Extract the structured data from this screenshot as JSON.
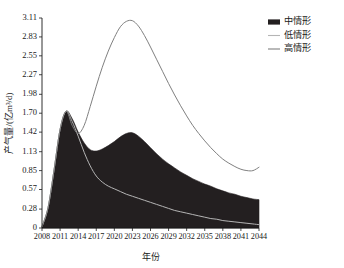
{
  "chart_data": {
    "type": "area",
    "title": "",
    "xlabel": "年份",
    "ylabel": "产气量/(亿m³/d)",
    "xlim": [
      2008,
      2044
    ],
    "ylim": [
      0,
      3.11
    ],
    "grid": false,
    "legend_position": "top-right",
    "x_ticks": [
      "2008",
      "2011",
      "2014",
      "2017",
      "2020",
      "2023",
      "2026",
      "2029",
      "2032",
      "2035",
      "2038",
      "2041",
      "2044"
    ],
    "x_tick_values": [
      2008,
      2011,
      2014,
      2017,
      2020,
      2023,
      2026,
      2029,
      2032,
      2035,
      2038,
      2041,
      2044
    ],
    "y_ticks": [
      "0",
      "0.28",
      "0.57",
      "0.85",
      "1.13",
      "1.42",
      "1.70",
      "1.98",
      "2.27",
      "2.55",
      "2.83",
      "3.11"
    ],
    "y_tick_values": [
      0,
      0.28,
      0.57,
      0.85,
      1.13,
      1.42,
      1.7,
      1.98,
      2.27,
      2.55,
      2.83,
      3.11
    ],
    "x": [
      2008,
      2009,
      2010,
      2011,
      2012,
      2013,
      2014,
      2015,
      2016,
      2017,
      2018,
      2019,
      2020,
      2021,
      2022,
      2023,
      2024,
      2025,
      2026,
      2027,
      2028,
      2029,
      2030,
      2031,
      2032,
      2033,
      2034,
      2035,
      2036,
      2037,
      2038,
      2039,
      2040,
      2041,
      2042,
      2043,
      2044
    ],
    "series": [
      {
        "name": "中情形",
        "style": "filled-area",
        "color": "#231f20",
        "values": [
          0.02,
          0.3,
          0.86,
          1.46,
          1.73,
          1.62,
          1.42,
          1.26,
          1.16,
          1.14,
          1.17,
          1.22,
          1.28,
          1.35,
          1.4,
          1.41,
          1.36,
          1.28,
          1.19,
          1.1,
          1.02,
          0.95,
          0.89,
          0.83,
          0.78,
          0.73,
          0.69,
          0.65,
          0.62,
          0.58,
          0.55,
          0.52,
          0.5,
          0.47,
          0.45,
          0.43,
          0.42
        ]
      },
      {
        "name": "低情形",
        "style": "line",
        "color": "#b5b5b5",
        "values": [
          0.02,
          0.3,
          0.86,
          1.46,
          1.73,
          1.58,
          1.36,
          1.12,
          0.92,
          0.77,
          0.68,
          0.62,
          0.58,
          0.54,
          0.5,
          0.47,
          0.44,
          0.41,
          0.38,
          0.35,
          0.32,
          0.29,
          0.26,
          0.24,
          0.22,
          0.2,
          0.18,
          0.16,
          0.14,
          0.13,
          0.11,
          0.1,
          0.09,
          0.08,
          0.07,
          0.06,
          0.05
        ]
      },
      {
        "name": "高情形",
        "style": "line",
        "color": "#808080",
        "values": [
          0.02,
          0.3,
          0.86,
          1.46,
          1.73,
          1.52,
          1.4,
          1.52,
          1.8,
          2.1,
          2.38,
          2.62,
          2.82,
          2.98,
          3.06,
          3.07,
          2.99,
          2.85,
          2.68,
          2.5,
          2.32,
          2.14,
          1.97,
          1.81,
          1.66,
          1.52,
          1.4,
          1.29,
          1.19,
          1.1,
          1.02,
          0.96,
          0.91,
          0.87,
          0.85,
          0.85,
          0.9
        ]
      }
    ],
    "annotations": []
  },
  "legend": {
    "items": [
      {
        "label": "中情形",
        "marker": "swatch",
        "color": "#231f20"
      },
      {
        "label": "低情形",
        "marker": "line",
        "color": "#b5b5b5"
      },
      {
        "label": "高情形",
        "marker": "line",
        "color": "#808080"
      }
    ]
  }
}
